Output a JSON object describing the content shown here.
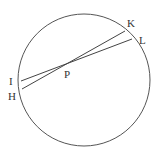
{
  "diagram": {
    "type": "geometry",
    "circle": {
      "cx": 84,
      "cy": 80,
      "r": 66,
      "stroke": "#555555"
    },
    "intersection": {
      "label": "P",
      "x": 67,
      "y": 63
    },
    "chords": [
      {
        "name": "HK",
        "from": "H",
        "to": "K"
      },
      {
        "name": "IL",
        "from": "I",
        "to": "L"
      }
    ],
    "points": [
      {
        "label": "K",
        "x": 125,
        "y": 31
      },
      {
        "label": "L",
        "x": 132,
        "y": 39
      },
      {
        "label": "I",
        "x": 21,
        "y": 81
      },
      {
        "label": "H",
        "x": 22,
        "y": 89
      },
      {
        "label": "P",
        "x": 67,
        "y": 63
      }
    ],
    "labels": {
      "K": "K",
      "L": "L",
      "I": "I",
      "H": "H",
      "P": "P"
    }
  }
}
